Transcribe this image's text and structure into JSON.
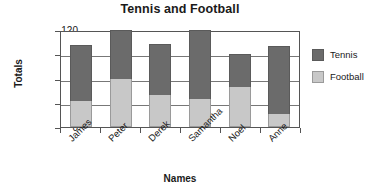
{
  "chart_data": {
    "type": "bar",
    "subtype": "stacked",
    "title": "Tennis and Football",
    "xlabel": "Names",
    "ylabel": "Totals",
    "categories": [
      "James",
      "Peter",
      "Derek",
      "Samantha",
      "Noel",
      "Anne"
    ],
    "series": [
      {
        "name": "Football",
        "values": [
          32,
          60,
          40,
          35,
          49,
          16
        ],
        "color": "#c8c8c8"
      },
      {
        "name": "Tennis",
        "values": [
          70,
          60,
          63,
          85,
          41,
          84
        ],
        "color": "#6b6b6b"
      }
    ],
    "totals": [
      102,
      120,
      103,
      120,
      90,
      100
    ],
    "ylim": [
      0,
      120
    ],
    "yticks": [
      0,
      30,
      60,
      90,
      120
    ],
    "ytick_labels": [
      "0",
      "30",
      "60",
      "90",
      "120"
    ],
    "grid": true,
    "legend_position": "right",
    "legend_entries": [
      "Tennis",
      "Football"
    ]
  }
}
